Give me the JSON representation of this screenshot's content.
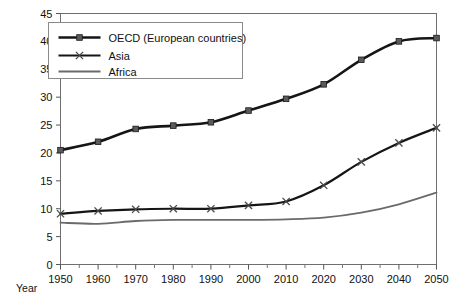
{
  "chart_data": {
    "type": "line",
    "title": "",
    "xlabel": "Year",
    "ylabel": "",
    "xlim": [
      1950,
      2050
    ],
    "ylim": [
      0,
      45
    ],
    "grid": false,
    "legend_position": "top-left",
    "x": [
      1950,
      1960,
      1970,
      1980,
      1990,
      2000,
      2010,
      2020,
      2030,
      2040,
      2050
    ],
    "xticks": [
      "1950",
      "1960",
      "1970",
      "1980",
      "1990",
      "2000",
      "2010",
      "2020",
      "2030",
      "2040",
      "2050"
    ],
    "xminor_ticks": [
      1955,
      1965,
      1975,
      1985,
      1995,
      2005,
      2015,
      2025,
      2035,
      2045
    ],
    "yticks": [
      "0",
      "5",
      "10",
      "15",
      "20",
      "25",
      "30",
      "35",
      "40",
      "45"
    ],
    "ytick_values": [
      0,
      5,
      10,
      15,
      20,
      25,
      30,
      35,
      40,
      45
    ],
    "series": [
      {
        "name": "OECD (European countries)",
        "marker": "square",
        "color": "#151515",
        "width": 2.6,
        "values": [
          20.5,
          22.0,
          24.3,
          24.9,
          25.5,
          27.6,
          29.7,
          32.3,
          36.7,
          40.0,
          40.6
        ]
      },
      {
        "name": "Asia",
        "marker": "x",
        "color": "#151515",
        "width": 2.2,
        "values": [
          9.1,
          9.6,
          9.9,
          10.0,
          10.0,
          10.6,
          11.3,
          14.2,
          18.4,
          21.8,
          24.5
        ]
      },
      {
        "name": "Africa",
        "marker": "none",
        "color": "#6a6a6a",
        "width": 1.8,
        "values": [
          7.5,
          7.3,
          7.8,
          8.0,
          8.0,
          8.0,
          8.1,
          8.4,
          9.3,
          10.8,
          12.9
        ]
      }
    ]
  },
  "legend": {
    "entries": [
      {
        "label": "OECD (European countries)"
      },
      {
        "label": "Asia"
      },
      {
        "label": "Africa"
      }
    ]
  },
  "axis": {
    "x_title": "Year"
  }
}
